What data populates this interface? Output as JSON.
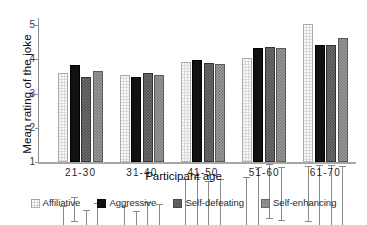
{
  "chart_data": {
    "type": "bar",
    "title": "",
    "xlabel": "Participant age",
    "ylabel": "Mean rating of the joke",
    "categories": [
      "21-30",
      "31-40",
      "41-50",
      "51-60",
      "61-70"
    ],
    "ylim": [
      1,
      5
    ],
    "yticks": [
      1,
      2,
      3,
      4,
      5
    ],
    "grid": false,
    "legend_position": "bottom",
    "error_bars": "present",
    "series": [
      {
        "name": "Affiliative",
        "color": "#d9d9d9",
        "values": [
          3.6,
          3.55,
          3.93,
          4.03,
          5.03
        ],
        "err_low": [
          3.27,
          3.17,
          3.15,
          3.27,
          3.48
        ],
        "err_high": [
          3.93,
          3.93,
          4.72,
          4.78,
          5.1
        ]
      },
      {
        "name": "Aggressive",
        "color": "#111111",
        "values": [
          3.84,
          3.49,
          3.98,
          4.33,
          4.43
        ],
        "err_low": [
          3.49,
          3.22,
          3.15,
          3.2,
          3.08
        ],
        "err_high": [
          4.18,
          3.77,
          4.77,
          5.05,
          5.12
        ]
      },
      {
        "name": "Self-defeating",
        "color": "#6e6e6e",
        "values": [
          3.47,
          3.61,
          3.88,
          4.37,
          4.42
        ],
        "err_low": [
          3.17,
          3.22,
          3.1,
          3.57,
          2.84
        ],
        "err_high": [
          3.79,
          4.04,
          4.66,
          5.16,
          5.12
        ]
      },
      {
        "name": "Self-enhancing",
        "color": "#9a9a9a",
        "values": [
          3.67,
          3.55,
          3.87,
          4.32,
          4.62
        ],
        "err_low": [
          3.23,
          3.17,
          3.07,
          3.52,
          3.0
        ],
        "err_high": [
          4.0,
          3.97,
          4.72,
          5.06,
          5.08
        ]
      }
    ]
  },
  "legend": {
    "items": [
      {
        "label": "Affiliative",
        "swatch": "affiliative-swatch"
      },
      {
        "label": "Aggressive",
        "swatch": "aggressive-swatch"
      },
      {
        "label": "Self-defeating",
        "swatch": "self-defeating-swatch"
      },
      {
        "label": "Self-enhancing",
        "swatch": "self-enhancing-swatch"
      }
    ]
  }
}
